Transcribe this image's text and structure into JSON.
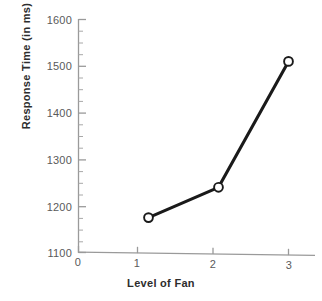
{
  "chart_data": {
    "type": "line",
    "title": "",
    "xlabel": "Level of Fan",
    "ylabel": "Response Time (in ms)",
    "x": [
      1,
      2,
      3
    ],
    "values": [
      1175,
      1240,
      1510
    ],
    "series": [
      {
        "name": "Response Time",
        "values": [
          1175,
          1240,
          1510
        ]
      }
    ],
    "xlim": [
      0,
      3.25
    ],
    "ylim": [
      1100,
      1620
    ],
    "xtick_labels": [
      "0",
      "1",
      "2",
      "3"
    ],
    "xticks": [
      0,
      1,
      2,
      3
    ],
    "ytick_labels": [
      "1100",
      "1200",
      "1300",
      "1400",
      "1500",
      "1600"
    ],
    "yticks": [
      1100,
      1200,
      1300,
      1400,
      1500,
      1600
    ],
    "y_minor_tick_step": 25,
    "grid": false,
    "legend": "none",
    "marker": "open-circle",
    "line_color": "#1a1a1a",
    "marker_face_color": "#ffffff",
    "axis_color": "#8c8c8c",
    "background_color": "#ffffff",
    "annotations": []
  },
  "axes": {
    "x_title": "Level of Fan",
    "y_title": "Response Time (in ms)"
  }
}
